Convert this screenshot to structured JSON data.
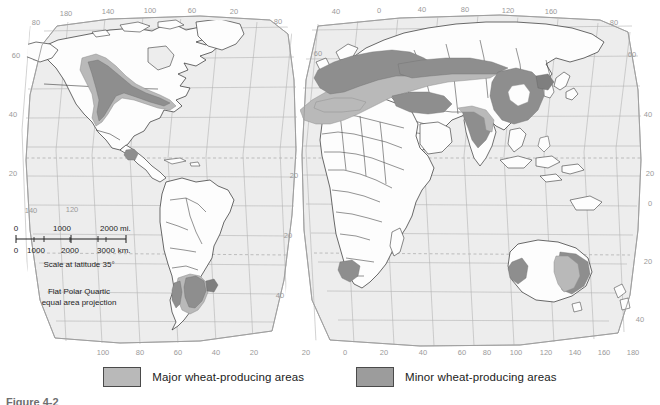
{
  "map": {
    "title": "World wheat production",
    "projection_note_line1": "Flat Polar Quartic",
    "projection_note_line2": "equal area projection",
    "scale_note": "Scale at latitude 35°",
    "scale_miles": {
      "ticks": [
        "0",
        "1000",
        "2000"
      ],
      "unit": "mi."
    },
    "scale_km": {
      "ticks": [
        "0",
        "1000",
        "2000",
        "3000"
      ],
      "unit": "km."
    },
    "background_land": "#fdfdfd",
    "background_ocean": "#ededed",
    "graticule_color": "#b0b0b0",
    "coast_color": "#3a3a3a"
  },
  "legend": {
    "items": [
      {
        "label": "Major wheat-producing areas",
        "color": "#b9b9b9",
        "key": "major"
      },
      {
        "label": "Minor wheat-producing areas",
        "color": "#9c9c9c",
        "key": "minor"
      }
    ]
  },
  "graticule": {
    "top_left_longitudes": [
      "180",
      "140",
      "100",
      "60",
      "20"
    ],
    "top_right_longitudes": [
      "40",
      "0",
      "40",
      "80",
      "120",
      "160"
    ],
    "bottom_left_longitudes": [
      "100",
      "80",
      "60",
      "40",
      "20"
    ],
    "bottom_right_longitudes": [
      "20",
      "0",
      "20",
      "40",
      "60",
      "80",
      "100",
      "120",
      "140",
      "160",
      "180"
    ],
    "left_latitudes": [
      "80",
      "60",
      "40",
      "20"
    ],
    "left_lower_longitudes": [
      "140",
      "120"
    ],
    "right_latitudes": [
      "80",
      "60",
      "40",
      "20",
      "0",
      "20",
      "40"
    ],
    "western_corner_latitudes": [
      "80",
      "60"
    ]
  },
  "caption": {
    "text": "Figure 4-2"
  }
}
